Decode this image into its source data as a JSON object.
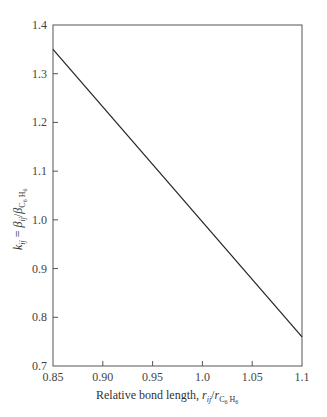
{
  "chart_data": {
    "type": "line",
    "title": "",
    "xlabel": "Relative bond length, r_ij / r_C6H6",
    "ylabel": "k_ij = β_ij / β_C6H6",
    "xlim": [
      0.85,
      1.1
    ],
    "ylim": [
      0.7,
      1.4
    ],
    "xticks": [
      "0.85",
      "0.90",
      "0.95",
      "1.0",
      "1.05",
      "1.1"
    ],
    "yticks": [
      "0.7",
      "0.8",
      "0.9",
      "1.0",
      "1.1",
      "1.2",
      "1.3",
      "1.4"
    ],
    "grid": false,
    "legend": null,
    "series": [
      {
        "name": "k_ij vs relative bond length",
        "x": [
          0.85,
          1.1
        ],
        "y": [
          1.35,
          0.76
        ]
      }
    ]
  },
  "labels": {
    "xlabel_prefix": "Relative bond length, ",
    "xlabel_r": "r",
    "xlabel_ij": "ij",
    "xlabel_slash": "/",
    "xlabel_r2": "r",
    "xlabel_sub": "C",
    "xlabel_sub6": "6",
    "xlabel_subH": " H",
    "xlabel_subH6": "6",
    "ylabel_k": "k",
    "ylabel_ij": "ij",
    "ylabel_eq": " = ",
    "ylabel_beta": "β",
    "ylabel_ij2": "ij",
    "ylabel_slash": "/",
    "ylabel_beta2": "β",
    "ylabel_sub": "C",
    "ylabel_sub6": "6",
    "ylabel_subH": " H",
    "ylabel_subH6": "6"
  }
}
